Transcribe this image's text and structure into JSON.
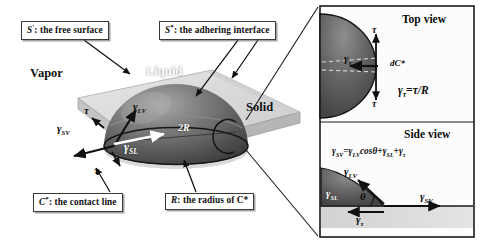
{
  "figure": {
    "type": "scientific-diagram"
  },
  "callouts": [
    {
      "id": "free-surface",
      "symbol": "S",
      "mark": "'",
      "text": ": the free surface"
    },
    {
      "id": "adhering-interface",
      "symbol": "S",
      "mark": "*",
      "text": ": the adhering interface"
    },
    {
      "id": "contact-line",
      "symbol": "C",
      "mark": "*",
      "text": ": the contact line"
    },
    {
      "id": "radius",
      "symbol": "R",
      "mark": "",
      "text": ": the radius of C*"
    }
  ],
  "phases": {
    "vapor": "Vapor",
    "liquid": "Liquid",
    "solid": "Solid"
  },
  "main_diagram": {
    "diameter_label": "2R",
    "vectors": [
      {
        "name": "gamma-LV",
        "base": "γ",
        "sub": "LV"
      },
      {
        "name": "gamma-SV",
        "base": "γ",
        "sub": "SV"
      },
      {
        "name": "gamma-SL",
        "base": "γ",
        "sub": "SL"
      },
      {
        "name": "tau-upper",
        "base": "τ",
        "sub": ""
      },
      {
        "name": "tau-lower",
        "base": "τ",
        "sub": ""
      }
    ]
  },
  "top_view": {
    "title": "Top view",
    "tau_upper": "τ",
    "tau_lower": "τ",
    "gamma_tau": {
      "base": "γ",
      "sub": "τ"
    },
    "arc_element": "dC*",
    "relation": "γᵧ=τ/R",
    "relation_parts": {
      "lhs_base": "γ",
      "lhs_sub": "τ",
      "rhs": "=τ/R"
    }
  },
  "side_view": {
    "title": "Side view",
    "equation": "γSV=γLVcosθ+γSL+γτ",
    "equation_parts": {
      "t1_base": "γ",
      "t1_sub": "SV",
      "op1": "=",
      "t2_base": "γ",
      "t2_sub": "LV",
      "cos": "cosθ",
      "op2": "+",
      "t3_base": "γ",
      "t3_sub": "SL",
      "op3": "+",
      "t4_base": "γ",
      "t4_sub": "τ"
    },
    "gamma_LV": {
      "base": "γ",
      "sub": "LV"
    },
    "gamma_SL": {
      "base": "γ",
      "sub": "SL"
    },
    "gamma_SV": {
      "base": "γ",
      "sub": "SV"
    },
    "gamma_tau": {
      "base": "γ",
      "sub": "τ"
    },
    "theta": "θ"
  },
  "colors": {
    "background": "#ffffff",
    "droplet_dark": "#4a4a4a",
    "droplet_mid": "#6e6e6e",
    "droplet_light": "#9a9a9a",
    "substrate_top": "#dcdcdc",
    "substrate_side": "#c2c2c2",
    "panel_fill": "#fbfbfb",
    "panel_band": "#d9d9d9",
    "stroke": "#1a1a1a",
    "box_border": "#3a3a3a"
  }
}
